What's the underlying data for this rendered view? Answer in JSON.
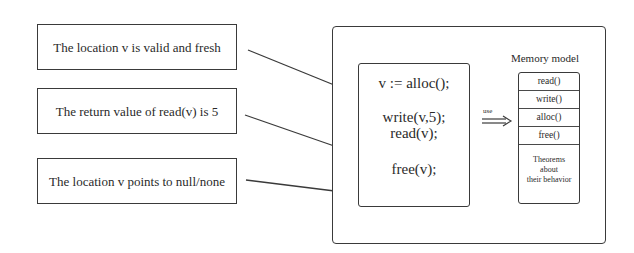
{
  "claims": [
    {
      "text": "The location v is valid and fresh"
    },
    {
      "text": "The return value of read(v) is 5"
    },
    {
      "text": "The location v points to null/none"
    }
  ],
  "program": {
    "lines": [
      "v := alloc();",
      "write(v,5);",
      "read(v);",
      "free(v);"
    ]
  },
  "arrow": {
    "label": "use"
  },
  "memory_model": {
    "title": "Memory model",
    "operations": [
      "read()",
      "write()",
      "alloc()",
      "free()"
    ],
    "theorems": [
      "Theorems",
      "about",
      "their behavior"
    ]
  },
  "colors": {
    "stroke": "#3a3a3a",
    "text": "#2a2a2a",
    "background": "#ffffff"
  }
}
